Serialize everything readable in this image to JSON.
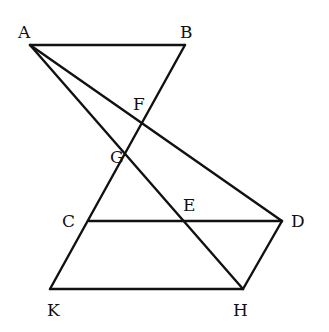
{
  "diagram": {
    "points": {
      "A": {
        "label": "A",
        "x": 30,
        "y": 45
      },
      "B": {
        "label": "B",
        "x": 185,
        "y": 45
      },
      "F": {
        "label": "F",
        "x": 143,
        "y": 122
      },
      "G": {
        "label": "G",
        "x": 127,
        "y": 150
      },
      "C": {
        "label": "C",
        "x": 89,
        "y": 221
      },
      "E": {
        "label": "E",
        "x": 183,
        "y": 221
      },
      "D": {
        "label": "D",
        "x": 282,
        "y": 221
      },
      "K": {
        "label": "K",
        "x": 50,
        "y": 289
      },
      "H": {
        "label": "H",
        "x": 243,
        "y": 289
      }
    },
    "segments": [
      [
        "A",
        "B"
      ],
      [
        "B",
        "K"
      ],
      [
        "A",
        "H"
      ],
      [
        "A",
        "D"
      ],
      [
        "C",
        "D"
      ],
      [
        "K",
        "H"
      ],
      [
        "D",
        "H"
      ]
    ]
  }
}
